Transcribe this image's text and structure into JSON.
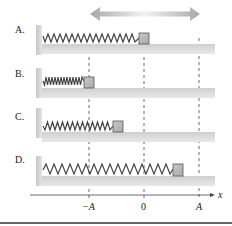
{
  "diagram": {
    "title_arrow": "double-headed arrow indicating oscillation",
    "rows": [
      {
        "label": "A.",
        "position": "0",
        "block_x": 139
      },
      {
        "label": "B.",
        "position": "-A",
        "block_x": 84
      },
      {
        "label": "C.",
        "position": "between -A and 0",
        "block_x": 113
      },
      {
        "label": "D.",
        "position": "between 0 and A",
        "block_x": 173
      }
    ],
    "axis": {
      "variable": "x",
      "ticks": [
        "−A",
        "0",
        "A"
      ]
    },
    "colors": {
      "block_fill": "#b8b8b8",
      "block_stroke": "#555555",
      "floor": "#d6d6d6",
      "spring": "#444444",
      "arrow": "#aaaaaa",
      "dashed": "#444444"
    }
  }
}
